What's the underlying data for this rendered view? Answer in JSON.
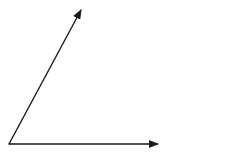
{
  "diagram": {
    "type": "angle",
    "stroke_color": "#1a1a1a",
    "background": "#ffffff",
    "vertex": {
      "x": 9,
      "y": 144
    },
    "rays": [
      {
        "name": "upper-ray",
        "to": {
          "x": 81,
          "y": 10
        }
      },
      {
        "name": "horizontal-ray",
        "to": {
          "x": 158,
          "y": 144
        }
      }
    ]
  }
}
